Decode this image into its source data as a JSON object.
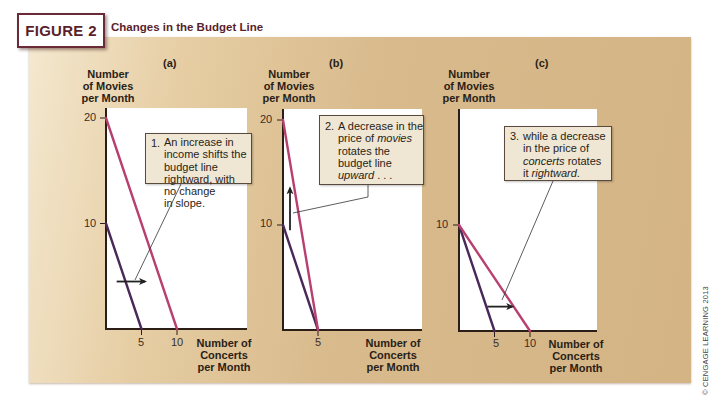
{
  "figure": {
    "label": "FIGURE 2",
    "title": "Changes in the Budget Line"
  },
  "copyright": "© CENGAGE LEARNING 2013",
  "axis_titles": {
    "y": [
      "Number",
      "of Movies",
      "per Month"
    ],
    "x": [
      "Number of",
      "Concerts",
      "per Month"
    ]
  },
  "panels": [
    {
      "tag": "(a)",
      "y_ticks": [
        "20",
        "10"
      ],
      "x_ticks": [
        "5",
        "10"
      ],
      "callout": {
        "num": "1.",
        "lines": [
          [
            {
              "t": "An increase in",
              "i": false
            }
          ],
          [
            {
              "t": "income shifts the",
              "i": false
            }
          ],
          [
            {
              "t": "budget line",
              "i": false
            }
          ],
          [
            {
              "t": "rightward, with",
              "i": false
            }
          ],
          [
            {
              "t": "no change",
              "i": false
            }
          ],
          [
            {
              "t": "in slope.",
              "i": false
            }
          ]
        ]
      }
    },
    {
      "tag": "(b)",
      "y_ticks": [
        "20",
        "10"
      ],
      "x_ticks": [
        "5"
      ],
      "callout": {
        "num": "2.",
        "lines": [
          [
            {
              "t": "A decrease in the",
              "i": false
            }
          ],
          [
            {
              "t": "price of ",
              "i": false
            },
            {
              "t": "movies",
              "i": true
            }
          ],
          [
            {
              "t": "rotates the",
              "i": false
            }
          ],
          [
            {
              "t": "budget line",
              "i": false
            }
          ],
          [
            {
              "t": "upward",
              "i": true
            },
            {
              "t": " . . .",
              "i": false
            }
          ]
        ]
      }
    },
    {
      "tag": "(c)",
      "y_ticks": [
        "10"
      ],
      "x_ticks": [
        "5",
        "10"
      ],
      "callout": {
        "num": "3.",
        "lines": [
          [
            {
              "t": "while a decrease",
              "i": false
            }
          ],
          [
            {
              "t": "in the price of",
              "i": false
            }
          ],
          [
            {
              "t": "concerts",
              "i": true
            },
            {
              "t": " rotates",
              "i": false
            }
          ],
          [
            {
              "t": "it ",
              "i": false
            },
            {
              "t": "rightward",
              "i": true
            },
            {
              "t": ".",
              "i": false
            }
          ]
        ]
      }
    }
  ],
  "colors": {
    "original_line": "#4a2858",
    "new_line": "#b8406e",
    "axis": "#2a1e16",
    "arrow": "#222222",
    "title": "#5a1f2c"
  },
  "chart_data": [
    {
      "type": "line",
      "title": "(a)",
      "xlabel": "Number of Concerts per Month",
      "ylabel": "Number of Movies per Month",
      "xlim": [
        0,
        20
      ],
      "ylim": [
        0,
        20
      ],
      "x_ticks": [
        5,
        10
      ],
      "y_ticks": [
        10,
        20
      ],
      "series": [
        {
          "name": "Original budget line",
          "points": [
            [
              0,
              10
            ],
            [
              5,
              0
            ]
          ]
        },
        {
          "name": "After income increase",
          "points": [
            [
              0,
              20
            ],
            [
              10,
              0
            ]
          ]
        }
      ],
      "annotation": "1. An increase in income shifts the budget line rightward, with no change in slope.",
      "arrow": {
        "direction": "right",
        "from": [
          1.5,
          4.5
        ],
        "to": [
          5.5,
          4.5
        ]
      }
    },
    {
      "type": "line",
      "title": "(b)",
      "xlabel": "Number of Concerts per Month",
      "ylabel": "Number of Movies per Month",
      "xlim": [
        0,
        20
      ],
      "ylim": [
        0,
        20
      ],
      "x_ticks": [
        5
      ],
      "y_ticks": [
        10,
        20
      ],
      "series": [
        {
          "name": "Original budget line",
          "points": [
            [
              0,
              10
            ],
            [
              5,
              0
            ]
          ]
        },
        {
          "name": "After decrease in price of movies",
          "points": [
            [
              0,
              20
            ],
            [
              5,
              0
            ]
          ]
        }
      ],
      "annotation": "2. A decrease in the price of movies rotates the budget line upward . . .",
      "arrow": {
        "direction": "up",
        "from": [
          1,
          9.5
        ],
        "to": [
          1,
          13.5
        ]
      }
    },
    {
      "type": "line",
      "title": "(c)",
      "xlabel": "Number of Concerts per Month",
      "ylabel": "Number of Movies per Month",
      "xlim": [
        0,
        20
      ],
      "ylim": [
        0,
        20
      ],
      "x_ticks": [
        5,
        10
      ],
      "y_ticks": [
        10
      ],
      "series": [
        {
          "name": "Original budget line",
          "points": [
            [
              0,
              10
            ],
            [
              5,
              0
            ]
          ]
        },
        {
          "name": "After decrease in price of concerts",
          "points": [
            [
              0,
              10
            ],
            [
              10,
              0
            ]
          ]
        }
      ],
      "annotation": "3. while a decrease in the price of concerts rotates it rightward.",
      "arrow": {
        "direction": "right",
        "from": [
          4,
          2.3
        ],
        "to": [
          7.5,
          2.3
        ]
      }
    }
  ]
}
